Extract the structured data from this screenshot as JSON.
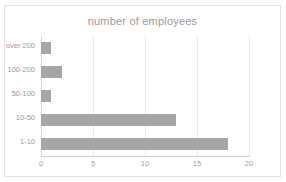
{
  "chart_data": {
    "type": "bar",
    "orientation": "horizontal",
    "title": "number of employees",
    "xlabel": "",
    "ylabel": "",
    "categories": [
      "over 200",
      "100-200",
      "50-100",
      "10-50",
      "1-10"
    ],
    "values": [
      1,
      2,
      1,
      13,
      18
    ],
    "xlim": [
      0,
      20
    ],
    "xticks": [
      0,
      5,
      10,
      15,
      20
    ],
    "xtick_labels": [
      "0",
      "5",
      "10",
      "15",
      "20"
    ],
    "grid": true,
    "grid_axis": "x",
    "legend": false,
    "bar_color": "#a6a6a6",
    "title_color": "#9b9b9b",
    "tick_color": "#a2a2a2",
    "gridline_color": "#eaeaea",
    "frame_border_color": "#e2e2e2",
    "background_color": "#ffffff"
  }
}
